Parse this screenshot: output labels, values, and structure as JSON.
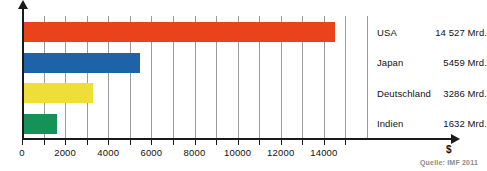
{
  "chart_data": {
    "type": "bar",
    "orientation": "horizontal",
    "title": "",
    "xlabel": "$",
    "ylabel": "",
    "xlim": [
      0,
      16000
    ],
    "grid": true,
    "grid_interval": 1000,
    "legend_position": "right",
    "categories": [
      "USA",
      "Japan",
      "Deutschland",
      "Indien"
    ],
    "values": [
      14527,
      5459,
      3286,
      1632
    ],
    "value_labels": [
      "14 527 Mrd.",
      "5459 Mrd.",
      "3286 Mrd.",
      "1632 Mrd."
    ],
    "colors": [
      "#E8431A",
      "#1E63A8",
      "#EFDE3A",
      "#159257"
    ],
    "tick_labels": [
      "0",
      "2000",
      "4000",
      "6000",
      "8000",
      "10000",
      "12000",
      "14000"
    ],
    "tick_values": [
      0,
      2000,
      4000,
      6000,
      8000,
      10000,
      12000,
      14000
    ],
    "annotations": [
      "Quelle: IMF 2011"
    ]
  },
  "axis": {
    "unit_symbol": "$"
  },
  "footer": {
    "source": "Quelle: IMF 2011"
  },
  "series": [
    {
      "name": "USA",
      "value_label": "14 527 Mrd.",
      "value": 14527,
      "color": "#E8431A"
    },
    {
      "name": "Japan",
      "value_label": "5459 Mrd.",
      "value": 5459,
      "color": "#1E63A8"
    },
    {
      "name": "Deutschland",
      "value_label": "3286 Mrd.",
      "value": 3286,
      "color": "#EFDE3A"
    },
    {
      "name": "Indien",
      "value_label": "1632 Mrd.",
      "value": 1632,
      "color": "#159257"
    }
  ]
}
